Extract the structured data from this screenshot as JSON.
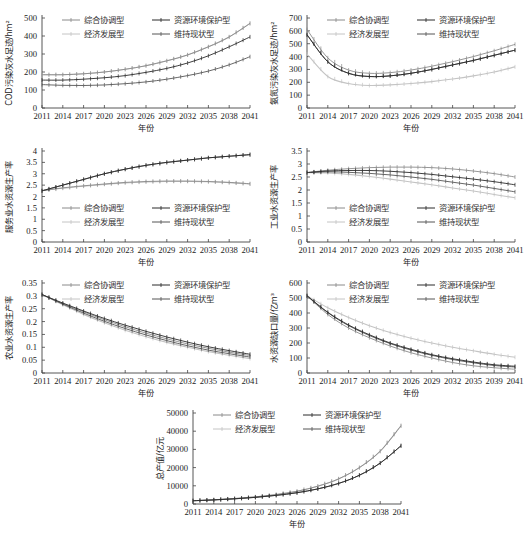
{
  "legend_labels": {
    "s1": "综合协调型",
    "s2": "资源环境保护型",
    "s3": "经济发展型",
    "s4": "维持现状型"
  },
  "series_colors": {
    "s1": "#8a8a8a",
    "s2": "#2a2a2a",
    "s3": "#c4c4c4",
    "s4": "#555555"
  },
  "chart_data": [
    {
      "id": "cod",
      "type": "line",
      "title": "",
      "xlabel": "年份",
      "ylabel": "COD污染灰水足迹/hm²",
      "x_ticks": [
        "2011",
        "2014",
        "2017",
        "2020",
        "2023",
        "2026",
        "2029",
        "2032",
        "2035",
        "2038",
        "2041"
      ],
      "ylim": [
        0,
        500
      ],
      "y_ticks": [
        0,
        100,
        200,
        300,
        400,
        500
      ],
      "legend_position": "top",
      "x": [
        2011,
        2014,
        2017,
        2020,
        2023,
        2026,
        2029,
        2032,
        2035,
        2038,
        2041
      ],
      "series": [
        {
          "key": "s1",
          "name": "综合协调型",
          "values": [
            185,
            185,
            190,
            200,
            215,
            235,
            262,
            295,
            340,
            395,
            470
          ]
        },
        {
          "key": "s2",
          "name": "资源环境保护型",
          "values": [
            155,
            155,
            160,
            168,
            180,
            198,
            220,
            250,
            290,
            340,
            395
          ]
        },
        {
          "key": "s3",
          "name": "经济发展型",
          "values": [
            185,
            185,
            190,
            200,
            215,
            235,
            262,
            295,
            340,
            395,
            470
          ]
        },
        {
          "key": "s4",
          "name": "维持现状型",
          "values": [
            130,
            126,
            125,
            128,
            135,
            145,
            160,
            180,
            205,
            240,
            285
          ]
        }
      ]
    },
    {
      "id": "ammonia",
      "type": "line",
      "title": "",
      "xlabel": "年份",
      "ylabel": "氨氮污染灰水足迹/hm²",
      "x_ticks": [
        "2011",
        "2014",
        "2017",
        "2020",
        "2023",
        "2026",
        "2029",
        "2032",
        "2035",
        "2038",
        "2041"
      ],
      "ylim": [
        0,
        700
      ],
      "y_ticks": [
        0,
        100,
        200,
        300,
        400,
        500,
        600,
        700
      ],
      "legend_position": "top",
      "x": [
        2011,
        2014,
        2017,
        2020,
        2023,
        2026,
        2029,
        2032,
        2035,
        2038,
        2041
      ],
      "series": [
        {
          "key": "s1",
          "name": "综合协调型",
          "values": [
            610,
            390,
            295,
            270,
            275,
            295,
            325,
            360,
            400,
            445,
            495
          ]
        },
        {
          "key": "s2",
          "name": "资源环境保护型",
          "values": [
            570,
            360,
            270,
            245,
            250,
            270,
            300,
            335,
            370,
            410,
            450
          ]
        },
        {
          "key": "s3",
          "name": "经济发展型",
          "values": [
            420,
            245,
            190,
            175,
            180,
            190,
            205,
            225,
            250,
            280,
            320
          ]
        },
        {
          "key": "s4",
          "name": "维持现状型",
          "values": [
            570,
            360,
            270,
            245,
            250,
            270,
            300,
            335,
            370,
            410,
            450
          ]
        }
      ]
    },
    {
      "id": "service",
      "type": "line",
      "title": "",
      "xlabel": "年份",
      "ylabel": "服务业水资源生产率",
      "x_ticks": [
        "2011",
        "2014",
        "2017",
        "2020",
        "2023",
        "2026",
        "2029",
        "2032",
        "2035",
        "2038",
        "2041"
      ],
      "ylim": [
        0,
        4
      ],
      "y_ticks": [
        0,
        0.5,
        1,
        1.5,
        2,
        2.5,
        3,
        3.5,
        4
      ],
      "legend_position": "bottom",
      "x": [
        2011,
        2014,
        2017,
        2020,
        2023,
        2026,
        2029,
        2032,
        2035,
        2038,
        2041
      ],
      "series": [
        {
          "key": "s1",
          "name": "综合协调型",
          "values": [
            2.25,
            2.38,
            2.47,
            2.55,
            2.62,
            2.66,
            2.68,
            2.68,
            2.66,
            2.62,
            2.56
          ]
        },
        {
          "key": "s2",
          "name": "资源环境保护型",
          "values": [
            2.25,
            2.5,
            2.75,
            3.0,
            3.2,
            3.37,
            3.5,
            3.6,
            3.7,
            3.77,
            3.84
          ]
        },
        {
          "key": "s3",
          "name": "经济发展型",
          "values": [
            2.25,
            2.36,
            2.45,
            2.53,
            2.6,
            2.64,
            2.66,
            2.66,
            2.65,
            2.61,
            2.55
          ]
        },
        {
          "key": "s4",
          "name": "维持现状型",
          "values": [
            2.25,
            2.5,
            2.75,
            3.0,
            3.2,
            3.37,
            3.5,
            3.6,
            3.7,
            3.77,
            3.84
          ]
        }
      ]
    },
    {
      "id": "industry",
      "type": "line",
      "title": "",
      "xlabel": "年份",
      "ylabel": "工业水资源生产率",
      "x_ticks": [
        "2011",
        "2014",
        "2017",
        "2020",
        "2023",
        "2026",
        "2029",
        "2032",
        "2035",
        "2038",
        "2041"
      ],
      "ylim": [
        0,
        3.5
      ],
      "y_ticks": [
        0,
        0.5,
        1,
        1.5,
        2,
        2.5,
        3,
        3.5
      ],
      "legend_position": "bottom",
      "x": [
        2011,
        2014,
        2017,
        2020,
        2023,
        2026,
        2029,
        2032,
        2035,
        2038,
        2041
      ],
      "series": [
        {
          "key": "s1",
          "name": "综合协调型",
          "values": [
            2.67,
            2.76,
            2.82,
            2.86,
            2.88,
            2.88,
            2.86,
            2.81,
            2.73,
            2.63,
            2.5
          ]
        },
        {
          "key": "s2",
          "name": "资源环境保护型",
          "values": [
            2.67,
            2.73,
            2.75,
            2.75,
            2.72,
            2.67,
            2.6,
            2.51,
            2.42,
            2.32,
            2.2
          ]
        },
        {
          "key": "s3",
          "name": "经济发展型",
          "values": [
            2.67,
            2.66,
            2.6,
            2.52,
            2.42,
            2.31,
            2.2,
            2.08,
            1.96,
            1.83,
            1.7
          ]
        },
        {
          "key": "s4",
          "name": "维持现状型",
          "values": [
            2.67,
            2.7,
            2.68,
            2.64,
            2.58,
            2.5,
            2.41,
            2.3,
            2.19,
            2.06,
            1.93
          ]
        }
      ]
    },
    {
      "id": "agriculture",
      "type": "line",
      "title": "",
      "xlabel": "年份",
      "ylabel": "农业水资源生产率",
      "x_ticks": [
        "2011",
        "2014",
        "2017",
        "2020",
        "2023",
        "2026",
        "2029",
        "2032",
        "2035",
        "2038",
        "2041"
      ],
      "ylim": [
        0,
        0.35
      ],
      "y_ticks": [
        0,
        0.05,
        0.1,
        0.15,
        0.2,
        0.25,
        0.3,
        0.35
      ],
      "legend_position": "top",
      "x": [
        2011,
        2014,
        2017,
        2020,
        2023,
        2026,
        2029,
        2032,
        2035,
        2038,
        2041
      ],
      "series": [
        {
          "key": "s1",
          "name": "综合协调型",
          "values": [
            0.305,
            0.27,
            0.238,
            0.207,
            0.18,
            0.155,
            0.133,
            0.113,
            0.096,
            0.081,
            0.068
          ]
        },
        {
          "key": "s2",
          "name": "资源环境保护型",
          "values": [
            0.305,
            0.272,
            0.241,
            0.212,
            0.186,
            0.162,
            0.14,
            0.12,
            0.102,
            0.087,
            0.073
          ]
        },
        {
          "key": "s3",
          "name": "经济发展型",
          "values": [
            0.305,
            0.265,
            0.228,
            0.195,
            0.166,
            0.141,
            0.119,
            0.1,
            0.083,
            0.069,
            0.056
          ]
        },
        {
          "key": "s4",
          "name": "维持现状型",
          "values": [
            0.305,
            0.268,
            0.233,
            0.201,
            0.173,
            0.148,
            0.126,
            0.106,
            0.089,
            0.075,
            0.062
          ]
        }
      ]
    },
    {
      "id": "shortage",
      "type": "line",
      "title": "",
      "xlabel": "年份",
      "ylabel": "水资源缺口量/亿m³",
      "x_ticks": [
        "2011",
        "2014",
        "2017",
        "2020",
        "2023",
        "2026",
        "2029",
        "2032",
        "2035",
        "2039",
        "2041"
      ],
      "ylim": [
        0,
        600
      ],
      "y_ticks": [
        0,
        100,
        200,
        300,
        400,
        500,
        600
      ],
      "legend_position": "top",
      "x": [
        2011,
        2014,
        2017,
        2020,
        2023,
        2026,
        2029,
        2032,
        2035,
        2038,
        2041
      ],
      "series": [
        {
          "key": "s1",
          "name": "综合协调型",
          "values": [
            515,
            390,
            300,
            235,
            180,
            135,
            100,
            70,
            48,
            35,
            25
          ]
        },
        {
          "key": "s2",
          "name": "资源环境保护型",
          "values": [
            515,
            405,
            320,
            255,
            200,
            158,
            122,
            95,
            73,
            55,
            45
          ]
        },
        {
          "key": "s3",
          "name": "经济发展型",
          "values": [
            515,
            435,
            370,
            315,
            270,
            232,
            200,
            172,
            148,
            125,
            105
          ]
        },
        {
          "key": "s4",
          "name": "维持现状型",
          "values": [
            515,
            402,
            316,
            250,
            196,
            153,
            118,
            90,
            68,
            50,
            40
          ]
        }
      ]
    },
    {
      "id": "gdp",
      "type": "line",
      "title": "",
      "xlabel": "年份",
      "ylabel": "总产值/亿元",
      "x_ticks": [
        "2011",
        "2014",
        "2017",
        "2020",
        "2023",
        "2026",
        "2029",
        "2032",
        "2035",
        "2038",
        "2041"
      ],
      "ylim": [
        0,
        50000
      ],
      "y_ticks": [
        0,
        10000,
        20000,
        30000,
        40000,
        50000
      ],
      "legend_position": "top",
      "x": [
        2011,
        2014,
        2017,
        2020,
        2023,
        2026,
        2029,
        2032,
        2035,
        2038,
        2041
      ],
      "series": [
        {
          "key": "s1",
          "name": "综合协调型",
          "values": [
            1800,
            2300,
            3000,
            3900,
            5200,
            7000,
            9800,
            13800,
            20000,
            29000,
            43000
          ]
        },
        {
          "key": "s2",
          "name": "资源环境保护型",
          "values": [
            1800,
            2250,
            2850,
            3650,
            4750,
            6200,
            8300,
            11300,
            15800,
            22500,
            32000
          ]
        },
        {
          "key": "s3",
          "name": "经济发展型",
          "values": [
            1800,
            2300,
            3000,
            3900,
            5200,
            7000,
            9800,
            13800,
            20000,
            29000,
            43000
          ]
        },
        {
          "key": "s4",
          "name": "维持现状型",
          "values": [
            1800,
            2250,
            2850,
            3650,
            4750,
            6200,
            8300,
            11300,
            15800,
            22500,
            32000
          ]
        }
      ]
    }
  ],
  "layout": [
    {
      "chart": 0,
      "left": 0,
      "top": 0,
      "width": 262,
      "height": 136,
      "plot": {
        "x0": 42,
        "x1": 250,
        "y0": 18,
        "y1": 108
      }
    },
    {
      "chart": 1,
      "left": 265,
      "top": 0,
      "width": 266,
      "height": 136,
      "plot": {
        "x0": 42,
        "x1": 250,
        "y0": 18,
        "y1": 108
      }
    },
    {
      "chart": 2,
      "left": 0,
      "top": 136,
      "width": 262,
      "height": 136,
      "plot": {
        "x0": 42,
        "x1": 250,
        "y0": 15,
        "y1": 106
      }
    },
    {
      "chart": 3,
      "left": 265,
      "top": 136,
      "width": 266,
      "height": 136,
      "plot": {
        "x0": 42,
        "x1": 250,
        "y0": 15,
        "y1": 106
      }
    },
    {
      "chart": 4,
      "left": 0,
      "top": 272,
      "width": 262,
      "height": 130,
      "plot": {
        "x0": 42,
        "x1": 250,
        "y0": 11,
        "y1": 101
      }
    },
    {
      "chart": 5,
      "left": 265,
      "top": 272,
      "width": 266,
      "height": 130,
      "plot": {
        "x0": 42,
        "x1": 250,
        "y0": 11,
        "y1": 101
      }
    },
    {
      "chart": 6,
      "left": 140,
      "top": 404,
      "width": 270,
      "height": 134,
      "plot": {
        "x0": 53,
        "x1": 261,
        "y0": 9,
        "y1": 100
      }
    }
  ]
}
